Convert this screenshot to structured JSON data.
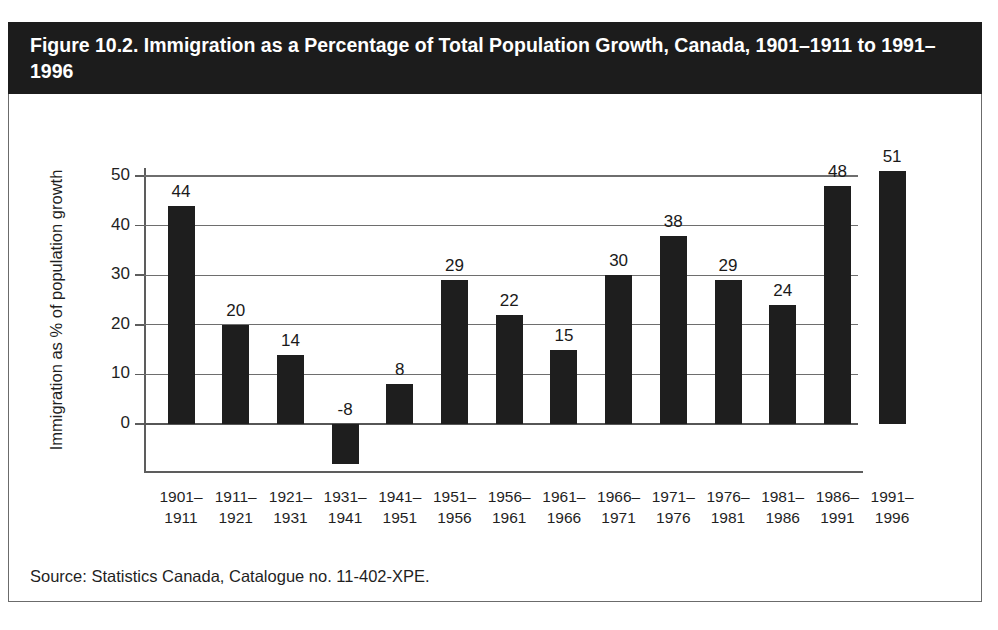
{
  "figure": {
    "title": "Figure 10.2. Immigration as a Percentage of Total Population Growth, Canada, 1901–1911 to 1991–1996",
    "source": "Source: Statistics Canada, Catalogue no. 11-402-XPE.",
    "title_band_color": "#1c1c1c",
    "title_text_color": "#ffffff",
    "bar_color": "#1e1e1e",
    "axis_color": "#5d5d5d",
    "background_color": "#ffffff"
  },
  "chart_data": {
    "type": "bar",
    "title": "Figure 10.2. Immigration as a Percentage of Total Population Growth, Canada, 1901–1911 to 1991–1996",
    "subtitle": "",
    "xlabel": "",
    "ylabel": "Immigration as % of population growth",
    "categories": [
      "1901–\n1911",
      "1911–\n1921",
      "1921–\n1931",
      "1931–\n1941",
      "1941–\n1951",
      "1951–\n1956",
      "1956–\n1961",
      "1961–\n1966",
      "1966–\n1971",
      "1971–\n1976",
      "1976–\n1981",
      "1981–\n1986",
      "1986–\n1991",
      "1991–\n1996"
    ],
    "category_lines": [
      [
        "1901–",
        "1911"
      ],
      [
        "1911–",
        "1921"
      ],
      [
        "1921–",
        "1931"
      ],
      [
        "1931–",
        "1941"
      ],
      [
        "1941–",
        "1951"
      ],
      [
        "1951–",
        "1956"
      ],
      [
        "1956–",
        "1961"
      ],
      [
        "1961–",
        "1966"
      ],
      [
        "1966–",
        "1971"
      ],
      [
        "1971–",
        "1976"
      ],
      [
        "1976–",
        "1981"
      ],
      [
        "1981–",
        "1986"
      ],
      [
        "1986–",
        "1991"
      ],
      [
        "1991–",
        "1996"
      ]
    ],
    "values": [
      44,
      20,
      14,
      -8,
      8,
      29,
      22,
      15,
      30,
      38,
      29,
      24,
      48,
      51
    ],
    "data_labels": [
      "44",
      "20",
      "14",
      "-8",
      "8",
      "29",
      "22",
      "15",
      "30",
      "38",
      "29",
      "24",
      "48",
      "51"
    ],
    "ylim": [
      -10,
      50
    ],
    "yticks": [
      0,
      10,
      20,
      30,
      40,
      50
    ],
    "ytick_labels": [
      "0",
      "10",
      "20",
      "30",
      "40",
      "50"
    ],
    "grid": true,
    "grid_axis": "y",
    "legend": false,
    "legend_position": "none",
    "series": [
      {
        "name": "Immigration as % of population growth",
        "values": [
          44,
          20,
          14,
          -8,
          8,
          29,
          22,
          15,
          30,
          38,
          29,
          24,
          48,
          51
        ]
      }
    ]
  }
}
